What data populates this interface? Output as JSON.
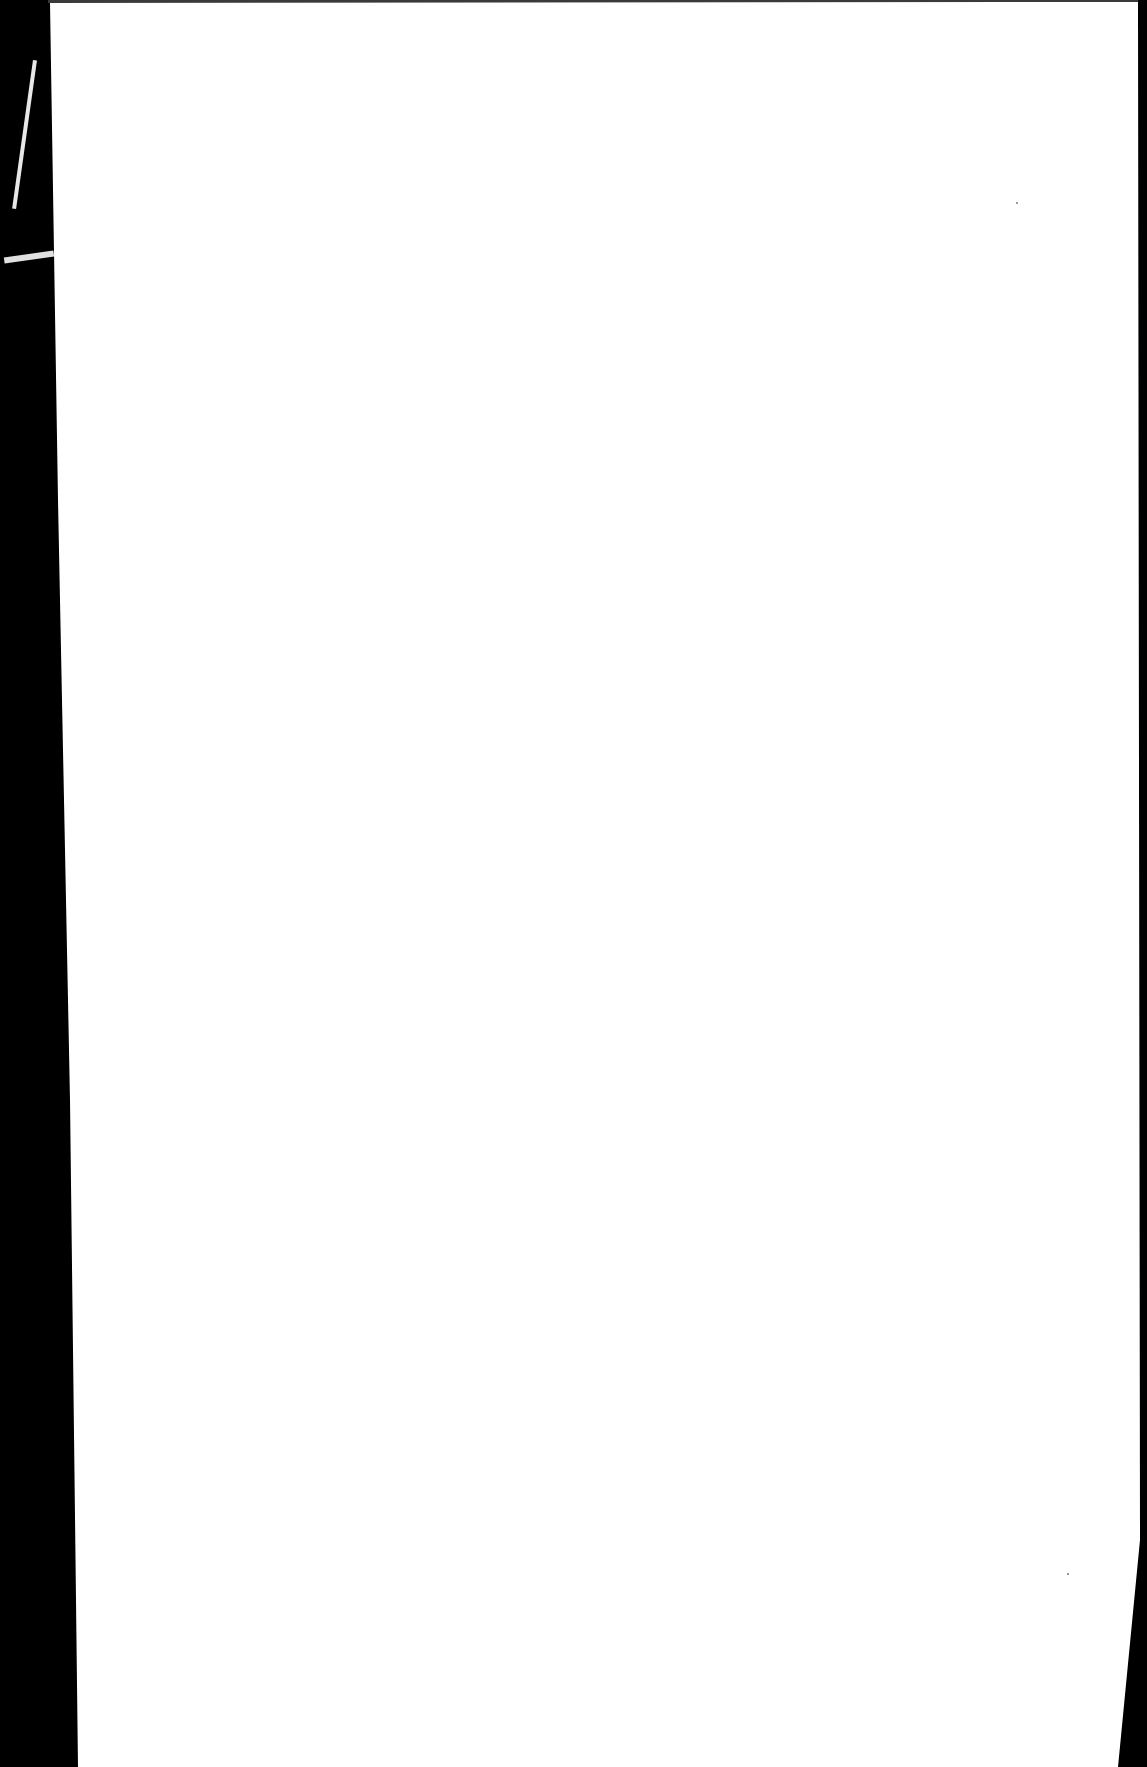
{
  "document": {
    "type": "scanned-page",
    "content": "",
    "colors": {
      "page": "#ffffff",
      "scanner_background": "#000000"
    }
  }
}
